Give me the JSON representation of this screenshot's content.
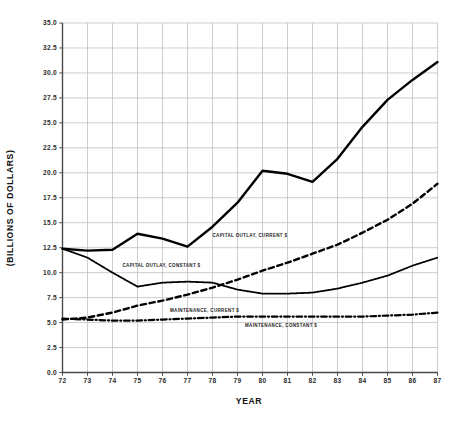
{
  "chart_data": {
    "type": "line",
    "title": "",
    "xlabel": "YEAR",
    "ylabel": "(BILLIONS OF DOLLARS)",
    "xlim": [
      72,
      87
    ],
    "ylim": [
      0.0,
      35.0
    ],
    "grid": true,
    "legend_position": "inline-annotations",
    "x": [
      72,
      73,
      74,
      75,
      76,
      77,
      78,
      79,
      80,
      81,
      82,
      83,
      84,
      85,
      86,
      87
    ],
    "xtick_labels": [
      "72",
      "73",
      "74",
      "75",
      "76",
      "77",
      "78",
      "79",
      "80",
      "81",
      "82",
      "83",
      "84",
      "85",
      "86",
      "87"
    ],
    "ytick_labels": [
      "0.0",
      "2.5",
      "5.0",
      "7.5",
      "10.0",
      "12.5",
      "15.0",
      "17.5",
      "20.0",
      "22.5",
      "25.0",
      "27.5",
      "30.0",
      "32.5",
      "35.0"
    ],
    "ytick_values": [
      0.0,
      2.5,
      5.0,
      7.5,
      10.0,
      12.5,
      15.0,
      17.5,
      20.0,
      22.5,
      25.0,
      27.5,
      30.0,
      32.5,
      35.0
    ],
    "series": [
      {
        "name": "CAPITAL OUTLAY, CURRENT $",
        "style": "solid",
        "color": "#000000",
        "width": 2.4,
        "label_x": 78.0,
        "label_y": 13.6,
        "values": [
          12.4,
          12.2,
          12.3,
          13.9,
          13.4,
          12.6,
          14.6,
          17.0,
          20.2,
          19.9,
          19.1,
          21.4,
          24.6,
          27.3,
          29.3,
          31.1
        ]
      },
      {
        "name": "CAPITAL OUTLAY, CONSTANT $",
        "style": "dotted",
        "color": "#000000",
        "width": 1.8,
        "label_x": 74.4,
        "label_y": 10.6,
        "values": [
          12.4,
          11.5,
          10.0,
          8.6,
          9.0,
          9.1,
          9.0,
          8.3,
          7.9,
          7.9,
          8.0,
          8.4,
          9.0,
          9.7,
          10.7,
          11.5
        ]
      },
      {
        "name": "MAINTENANCE, CURRENT $",
        "style": "dashed",
        "color": "#000000",
        "width": 2.4,
        "label_x": 76.3,
        "label_y": 6.1,
        "values": [
          5.3,
          5.5,
          6.0,
          6.7,
          7.2,
          7.8,
          8.5,
          9.3,
          10.2,
          11.0,
          11.9,
          12.8,
          14.0,
          15.3,
          16.9,
          18.9
        ]
      },
      {
        "name": "MAINTENANCE, CONSTANT $",
        "style": "dashdot",
        "color": "#000000",
        "width": 2.2,
        "label_x": 79.3,
        "label_y": 4.6,
        "values": [
          5.4,
          5.3,
          5.2,
          5.2,
          5.3,
          5.4,
          5.5,
          5.6,
          5.6,
          5.6,
          5.6,
          5.6,
          5.6,
          5.7,
          5.8,
          6.0
        ]
      }
    ]
  }
}
